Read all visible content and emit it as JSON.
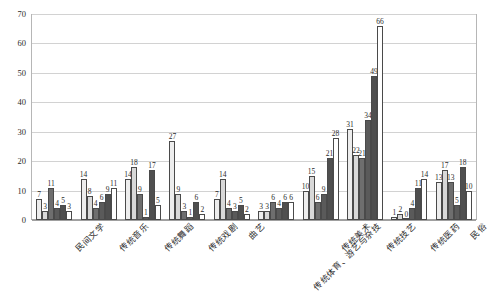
{
  "chart_data": {
    "type": "bar",
    "title": "",
    "subtitle": "",
    "xlabel": "",
    "ylabel": "",
    "ylim": [
      0,
      70
    ],
    "yticks": [
      0,
      10,
      20,
      30,
      40,
      50,
      60,
      70
    ],
    "grid": true,
    "legend": "none",
    "orientation": "vertical",
    "group_mode": "clustered",
    "categories": [
      "民间文学",
      "传统音乐",
      "传统舞蹈",
      "传统戏剧",
      "曲艺",
      "传统体育、游艺与杂技",
      "传统美术",
      "传统技艺",
      "传统医药",
      "民俗"
    ],
    "series": [
      {
        "name": "series-1",
        "values": [
          7,
          14,
          14,
          27,
          7,
          3,
          10,
          31,
          1,
          13
        ]
      },
      {
        "name": "series-2",
        "values": [
          3,
          8,
          18,
          9,
          14,
          3,
          15,
          22,
          2,
          17
        ]
      },
      {
        "name": "series-3",
        "values": [
          11,
          4,
          9,
          3,
          4,
          6,
          6,
          21,
          0,
          13
        ]
      },
      {
        "name": "series-4",
        "values": [
          4,
          6,
          1,
          1,
          3,
          4,
          9,
          34,
          4,
          5
        ]
      },
      {
        "name": "series-5",
        "values": [
          5,
          9,
          17,
          6,
          5,
          6,
          21,
          49,
          11,
          18
        ]
      },
      {
        "name": "series-6",
        "values": [
          3,
          11,
          5,
          2,
          2,
          6,
          28,
          66,
          14,
          10
        ]
      }
    ],
    "data_labels": [
      [
        "7",
        "3",
        "11",
        "4",
        "5",
        "3"
      ],
      [
        "14",
        "8",
        "4",
        "6",
        "9",
        "11"
      ],
      [
        "14",
        "18",
        "9",
        "1",
        "17",
        "5"
      ],
      [
        "27",
        "9",
        "3",
        "1",
        "6",
        "2"
      ],
      [
        "7",
        "14",
        "4",
        "3",
        "5",
        "2"
      ],
      [
        "3",
        "3",
        "6",
        "4",
        "6",
        "6"
      ],
      [
        "10",
        "15",
        "6",
        "9",
        "21",
        "28"
      ],
      [
        "31",
        "22",
        "21",
        "34",
        "49",
        "66"
      ],
      [
        "1",
        "2",
        "0",
        "4",
        "11",
        "14"
      ],
      [
        "13",
        "17",
        "13",
        "5",
        "18",
        "10"
      ]
    ],
    "colors": {
      "series": [
        "#ededed",
        "#d8d8d8",
        "#6e6e6e",
        "#5a5a5a",
        "#4f4f4f",
        "#ffffff"
      ],
      "bar_outline": "#4a4a4a",
      "gridline": "#d2d2d2",
      "axis": "#a0a0a0",
      "text": "#2b2b2b",
      "background": "#ffffff"
    }
  }
}
